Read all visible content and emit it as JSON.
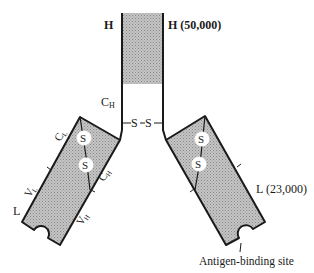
{
  "diagram": {
    "labels": {
      "heavy_left": "H",
      "heavy_right": "H (50,000)",
      "ch_stem": "C",
      "ch_stem_sub": "H",
      "disulfide_hinge": "S—S",
      "cl": "C",
      "cl_sub": "L",
      "vl": "V",
      "vl_sub": "L",
      "ch_arm": "C",
      "ch_arm_sub": "H",
      "vh": "V",
      "vh_sub": "H",
      "light_left": "L",
      "light_right": "L (23,000)",
      "antigen_site": "Antigen-binding site",
      "s_bond": "S"
    },
    "colors": {
      "shade": "#b8b8b8",
      "stroke": "#1a1a1a"
    }
  }
}
